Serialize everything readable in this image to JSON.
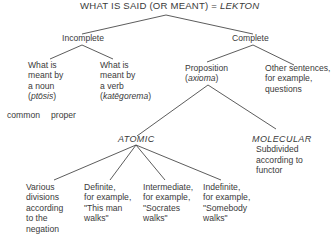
{
  "diagram": {
    "title": {
      "main": "WHAT IS SAID (OR MEANT) = ",
      "term": "LEKTON"
    },
    "level1": {
      "incomplete": "Incomplete",
      "complete": "Complete"
    },
    "incomplete_children": {
      "noun": {
        "lines": [
          "What is",
          "meant by",
          "a noun"
        ],
        "term_open": "(",
        "term": "ptōsis",
        "term_close": ")"
      },
      "verb": {
        "lines": [
          "What is",
          "meant by",
          "a verb"
        ],
        "term_open": "(",
        "term": "katēgorema",
        "term_close": ")"
      }
    },
    "noun_kinds": {
      "common": "common",
      "proper": "proper"
    },
    "complete_children": {
      "proposition": {
        "label": "Proposition",
        "term_open": "(",
        "term": "axioma",
        "term_close": ")"
      },
      "other": {
        "lines": [
          "Other sentences,",
          "for example,",
          "questions"
        ]
      }
    },
    "proposition_children": {
      "atomic": "ATOMIC",
      "molecular": {
        "label": "MOLECULAR",
        "lines": [
          "Subdivided",
          "according to",
          "functor"
        ]
      }
    },
    "atomic_children": [
      {
        "lines": [
          "Various",
          "divisions",
          "according",
          "to the",
          "negation"
        ]
      },
      {
        "lines": [
          "Definite,",
          "for example,",
          "\"This man",
          "walks\""
        ]
      },
      {
        "lines": [
          "Intermediate,",
          "for example,",
          "\"Socrates",
          "walks\""
        ]
      },
      {
        "lines": [
          "Indefinite,",
          "for example,",
          "\"Somebody",
          "walks\""
        ]
      }
    ]
  }
}
